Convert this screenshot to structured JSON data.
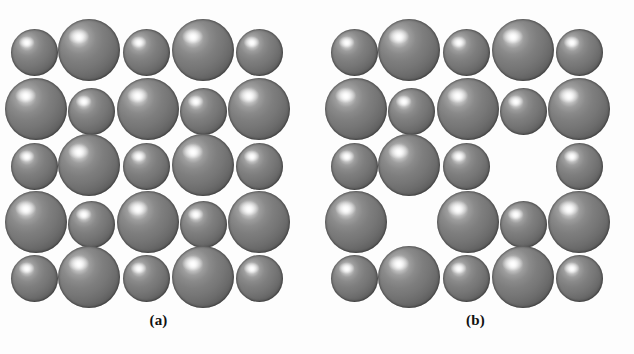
{
  "figure": {
    "background_color": "#fdfdfd",
    "width": 634,
    "height": 354,
    "sphere_fill_color": "#767676",
    "sphere_rim_color": "#1c1c1c",
    "sphere_highlight_color": "#ffffff"
  },
  "panels": [
    {
      "id": "a",
      "caption": "(a)",
      "description": "perfect ionic lattice",
      "origin_x": 0,
      "grid_rows": 5,
      "grid_cols": 5,
      "large_diameter": 62,
      "small_diameter": 47,
      "spheres": [
        {
          "row": 1,
          "col": 1,
          "size": "small",
          "cx": 34,
          "cy": 52,
          "d": 47
        },
        {
          "row": 1,
          "col": 2,
          "size": "large",
          "cx": 89,
          "cy": 50,
          "d": 62
        },
        {
          "row": 1,
          "col": 3,
          "size": "small",
          "cx": 146,
          "cy": 52,
          "d": 47
        },
        {
          "row": 1,
          "col": 4,
          "size": "large",
          "cx": 203,
          "cy": 50,
          "d": 62
        },
        {
          "row": 1,
          "col": 5,
          "size": "small",
          "cx": 259,
          "cy": 52,
          "d": 47
        },
        {
          "row": 2,
          "col": 1,
          "size": "large",
          "cx": 36,
          "cy": 109,
          "d": 62
        },
        {
          "row": 2,
          "col": 2,
          "size": "small",
          "cx": 91,
          "cy": 111,
          "d": 47
        },
        {
          "row": 2,
          "col": 3,
          "size": "large",
          "cx": 148,
          "cy": 109,
          "d": 62
        },
        {
          "row": 2,
          "col": 4,
          "size": "small",
          "cx": 203,
          "cy": 111,
          "d": 47
        },
        {
          "row": 2,
          "col": 5,
          "size": "large",
          "cx": 259,
          "cy": 109,
          "d": 62
        },
        {
          "row": 3,
          "col": 1,
          "size": "small",
          "cx": 34,
          "cy": 166,
          "d": 47
        },
        {
          "row": 3,
          "col": 2,
          "size": "large",
          "cx": 89,
          "cy": 165,
          "d": 62
        },
        {
          "row": 3,
          "col": 3,
          "size": "small",
          "cx": 146,
          "cy": 166,
          "d": 47
        },
        {
          "row": 3,
          "col": 4,
          "size": "large",
          "cx": 203,
          "cy": 165,
          "d": 62
        },
        {
          "row": 3,
          "col": 5,
          "size": "small",
          "cx": 259,
          "cy": 166,
          "d": 47
        },
        {
          "row": 4,
          "col": 1,
          "size": "large",
          "cx": 36,
          "cy": 222,
          "d": 62
        },
        {
          "row": 4,
          "col": 2,
          "size": "small",
          "cx": 91,
          "cy": 224,
          "d": 47
        },
        {
          "row": 4,
          "col": 3,
          "size": "large",
          "cx": 148,
          "cy": 222,
          "d": 62
        },
        {
          "row": 4,
          "col": 4,
          "size": "small",
          "cx": 203,
          "cy": 224,
          "d": 47
        },
        {
          "row": 4,
          "col": 5,
          "size": "large",
          "cx": 259,
          "cy": 222,
          "d": 62
        },
        {
          "row": 5,
          "col": 1,
          "size": "small",
          "cx": 34,
          "cy": 278,
          "d": 47
        },
        {
          "row": 5,
          "col": 2,
          "size": "large",
          "cx": 89,
          "cy": 277,
          "d": 62
        },
        {
          "row": 5,
          "col": 3,
          "size": "small",
          "cx": 146,
          "cy": 278,
          "d": 47
        },
        {
          "row": 5,
          "col": 4,
          "size": "large",
          "cx": 203,
          "cy": 277,
          "d": 62
        },
        {
          "row": 5,
          "col": 5,
          "size": "small",
          "cx": 259,
          "cy": 278,
          "d": 47
        }
      ]
    },
    {
      "id": "b",
      "caption": "(b)",
      "description": "lattice with vacancy defects",
      "origin_x": 317,
      "grid_rows": 5,
      "grid_cols": 5,
      "large_diameter": 62,
      "small_diameter": 47,
      "vacancies": [
        {
          "row": 3,
          "col": 4,
          "size": "large"
        },
        {
          "row": 4,
          "col": 2,
          "size": "small"
        }
      ],
      "spheres": [
        {
          "row": 1,
          "col": 1,
          "size": "small",
          "cx": 37,
          "cy": 52,
          "d": 47
        },
        {
          "row": 1,
          "col": 2,
          "size": "large",
          "cx": 92,
          "cy": 50,
          "d": 62
        },
        {
          "row": 1,
          "col": 3,
          "size": "small",
          "cx": 149,
          "cy": 52,
          "d": 47
        },
        {
          "row": 1,
          "col": 4,
          "size": "large",
          "cx": 206,
          "cy": 50,
          "d": 62
        },
        {
          "row": 1,
          "col": 5,
          "size": "small",
          "cx": 262,
          "cy": 52,
          "d": 47
        },
        {
          "row": 2,
          "col": 1,
          "size": "large",
          "cx": 39,
          "cy": 109,
          "d": 62
        },
        {
          "row": 2,
          "col": 2,
          "size": "small",
          "cx": 94,
          "cy": 111,
          "d": 47
        },
        {
          "row": 2,
          "col": 3,
          "size": "large",
          "cx": 151,
          "cy": 109,
          "d": 62
        },
        {
          "row": 2,
          "col": 4,
          "size": "small",
          "cx": 206,
          "cy": 111,
          "d": 47
        },
        {
          "row": 2,
          "col": 5,
          "size": "large",
          "cx": 262,
          "cy": 109,
          "d": 62
        },
        {
          "row": 3,
          "col": 1,
          "size": "small",
          "cx": 37,
          "cy": 166,
          "d": 47
        },
        {
          "row": 3,
          "col": 2,
          "size": "large",
          "cx": 92,
          "cy": 165,
          "d": 62
        },
        {
          "row": 3,
          "col": 3,
          "size": "small",
          "cx": 149,
          "cy": 166,
          "d": 47
        },
        {
          "row": 3,
          "col": 5,
          "size": "small",
          "cx": 262,
          "cy": 166,
          "d": 47
        },
        {
          "row": 4,
          "col": 1,
          "size": "large",
          "cx": 39,
          "cy": 222,
          "d": 62
        },
        {
          "row": 4,
          "col": 3,
          "size": "large",
          "cx": 151,
          "cy": 222,
          "d": 62
        },
        {
          "row": 4,
          "col": 4,
          "size": "small",
          "cx": 206,
          "cy": 224,
          "d": 47
        },
        {
          "row": 4,
          "col": 5,
          "size": "large",
          "cx": 262,
          "cy": 222,
          "d": 62
        },
        {
          "row": 5,
          "col": 1,
          "size": "small",
          "cx": 37,
          "cy": 278,
          "d": 47
        },
        {
          "row": 5,
          "col": 2,
          "size": "large",
          "cx": 92,
          "cy": 277,
          "d": 62
        },
        {
          "row": 5,
          "col": 3,
          "size": "small",
          "cx": 149,
          "cy": 278,
          "d": 47
        },
        {
          "row": 5,
          "col": 4,
          "size": "large",
          "cx": 206,
          "cy": 277,
          "d": 62
        },
        {
          "row": 5,
          "col": 5,
          "size": "small",
          "cx": 262,
          "cy": 278,
          "d": 47
        }
      ]
    }
  ]
}
